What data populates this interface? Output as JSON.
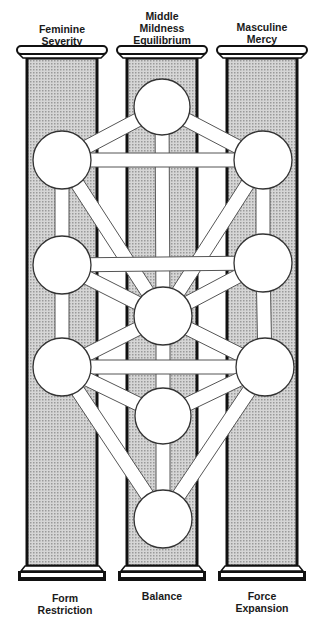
{
  "colors": {
    "ink": "#111111",
    "pillar_fill": "#c8c8c8",
    "path_fill": "#ffffff",
    "path_stroke": "#555555",
    "background": "#ffffff"
  },
  "pillars": [
    {
      "id": "left",
      "top_label": [
        "Feminine",
        "Severity"
      ],
      "bottom_label": [
        "Form",
        "Restriction"
      ],
      "x": 27,
      "w": 70
    },
    {
      "id": "middle",
      "top_label": [
        "Middle",
        "Mildness",
        "Equilibrium"
      ],
      "bottom_label": [
        "Balance"
      ],
      "x": 127,
      "w": 70
    },
    {
      "id": "right",
      "top_label": [
        "Masculine",
        "Mercy"
      ],
      "bottom_label": [
        "Force",
        "Expansion"
      ],
      "x": 227,
      "w": 70
    }
  ],
  "labels": {
    "left_top_1": "Feminine",
    "left_top_2": "Severity",
    "middle_top_1": "Middle",
    "middle_top_2": "Mildness",
    "middle_top_3": "Equilibrium",
    "right_top_1": "Masculine",
    "right_top_2": "Mercy",
    "left_bottom_1": "Form",
    "left_bottom_2": "Restriction",
    "middle_bottom_1": "Balance",
    "right_bottom_1": "Force",
    "right_bottom_2": "Expansion"
  },
  "sephiroth": [
    {
      "name": "sephira-1",
      "cx": 162,
      "cy": 107,
      "r": 28
    },
    {
      "name": "sephira-2",
      "cx": 263,
      "cy": 160,
      "r": 29
    },
    {
      "name": "sephira-3",
      "cx": 62,
      "cy": 160,
      "r": 29
    },
    {
      "name": "sephira-4",
      "cx": 263,
      "cy": 263,
      "r": 29
    },
    {
      "name": "sephira-5",
      "cx": 62,
      "cy": 265,
      "r": 29
    },
    {
      "name": "sephira-6",
      "cx": 163,
      "cy": 316,
      "r": 29
    },
    {
      "name": "sephira-7",
      "cx": 265,
      "cy": 367,
      "r": 29
    },
    {
      "name": "sephira-8",
      "cx": 62,
      "cy": 367,
      "r": 29
    },
    {
      "name": "sephira-9",
      "cx": 163,
      "cy": 416,
      "r": 28
    },
    {
      "name": "sephira-10",
      "cx": 163,
      "cy": 519,
      "r": 29
    }
  ],
  "paths": [
    [
      0,
      1
    ],
    [
      0,
      2
    ],
    [
      0,
      5
    ],
    [
      1,
      2
    ],
    [
      1,
      3
    ],
    [
      1,
      5
    ],
    [
      2,
      4
    ],
    [
      2,
      5
    ],
    [
      3,
      4
    ],
    [
      3,
      5
    ],
    [
      3,
      6
    ],
    [
      4,
      5
    ],
    [
      4,
      7
    ],
    [
      5,
      6
    ],
    [
      5,
      7
    ],
    [
      5,
      8
    ],
    [
      6,
      7
    ],
    [
      6,
      8
    ],
    [
      6,
      9
    ],
    [
      7,
      8
    ],
    [
      7,
      9
    ],
    [
      8,
      9
    ]
  ]
}
